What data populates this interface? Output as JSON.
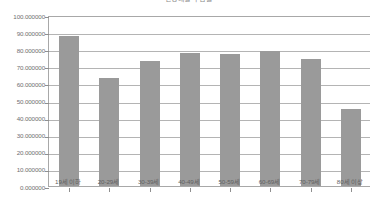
{
  "chart_data": {
    "type": "bar",
    "title": "연령대별 수검률",
    "xlabel": "",
    "ylabel": "",
    "ylim": [
      0,
      100
    ],
    "grid": true,
    "legend": false,
    "bar_color": "#9a9a9a",
    "categories": [
      "19세 이하",
      "20-29세",
      "30-39세",
      "40-49세",
      "50-59세",
      "60-69세",
      "70-79세",
      "80세 이상"
    ],
    "values": [
      87.5,
      63.2,
      73.0,
      77.8,
      77.3,
      79.2,
      74.4,
      45.2
    ],
    "ytick_labels": [
      "100.000000",
      "90.000000",
      "80.000000",
      "70.000000",
      "60.000000",
      "50.000000",
      "40.000000",
      "30.000000",
      "20.000000",
      "10.000000",
      "0.000000"
    ],
    "ytick_values": [
      100,
      90,
      80,
      70,
      60,
      50,
      40,
      30,
      20,
      10,
      0
    ]
  }
}
